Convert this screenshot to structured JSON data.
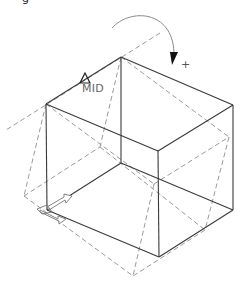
{
  "diagram": {
    "type": "isometric-box-rotation",
    "cut_off_label": "g",
    "snap_label": "MID",
    "rotation_sign": "+",
    "colors": {
      "solid_edges": "#3a3a3a",
      "dashed_edges": "#9a9a9a",
      "arc": "#8a8a8a",
      "arrow_head": "#111111"
    },
    "solid_box": {
      "vertices": {
        "top_back": [
          121,
          57
        ],
        "top_left": [
          46,
          104
        ],
        "top_right": [
          233,
          105
        ],
        "top_front": [
          158,
          151
        ],
        "bottom_back": [
          121,
          163
        ],
        "bottom_left": [
          47,
          210
        ],
        "bottom_right": [
          233,
          210
        ],
        "bottom_front": [
          159,
          257
        ]
      }
    },
    "dashed_box": {
      "vertices": {
        "top": [
          121,
          57
        ],
        "upper_left": [
          46,
          104
        ],
        "left": [
          24,
          196
        ],
        "bottom": [
          133,
          276
        ],
        "right": [
          229,
          137
        ],
        "inner_back": [
          100,
          147
        ],
        "inner_front": [
          154,
          184
        ],
        "right_lower": [
          205,
          230
        ]
      }
    },
    "rotation_axis_line": {
      "from": [
        160,
        33
      ],
      "to": [
        6,
        130
      ]
    }
  }
}
